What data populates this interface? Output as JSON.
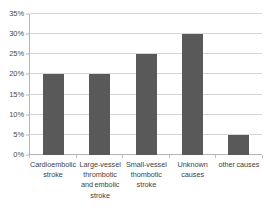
{
  "chart_data": {
    "type": "bar",
    "title": "",
    "subtitle": "",
    "xlabel": "",
    "ylabel": "",
    "categories": [
      "Cardioembolic stroke",
      "Large-vessel thrombotic and embolic stroke",
      "Small-vessel thombotic stroke",
      "Unknown causes",
      "other causes"
    ],
    "values": [
      20,
      20,
      25,
      30,
      5
    ],
    "value_labels": [
      "20%",
      "20%",
      "25%",
      "30%",
      "5%"
    ],
    "ylim": [
      0,
      35
    ],
    "ytick_values": [
      0,
      5,
      10,
      15,
      20,
      25,
      30,
      35
    ],
    "ytick_labels": [
      "0%",
      "5%",
      "10%",
      "15%",
      "20%",
      "25%",
      "30%",
      "35%"
    ],
    "grid": true,
    "grid_axis": "y",
    "legend": false,
    "legend_position": "none",
    "series": [
      {
        "name": "",
        "values": [
          20,
          20,
          25,
          30,
          5
        ]
      }
    ]
  },
  "style": {
    "bar_color": "#595959",
    "grid_color": "#d6d6d6",
    "axis_color": "#b6b6b6",
    "text_color": "#3f3f3f",
    "background": "#ffffff"
  }
}
